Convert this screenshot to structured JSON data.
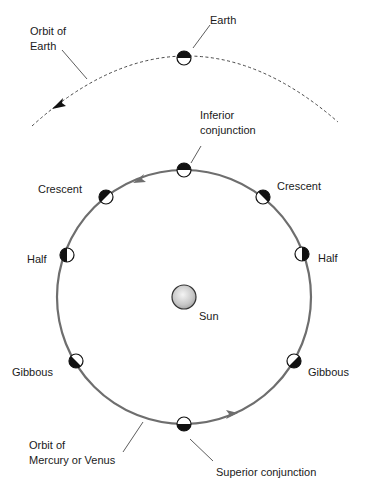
{
  "diagram": {
    "labels": {
      "earth": "Earth",
      "orbit_earth_line1": "Orbit of",
      "orbit_earth_line2": "Earth",
      "inferior_line1": "Inferior",
      "inferior_line2": "conjunction",
      "crescent_left": "Crescent",
      "crescent_right": "Crescent",
      "half_left": "Half",
      "half_right": "Half",
      "sun": "Sun",
      "gibbous_left": "Gibbous",
      "gibbous_right": "Gibbous",
      "orbit_inner_line1": "Orbit of",
      "orbit_inner_line2": "Mercury or Venus",
      "superior": "Superior conjunction"
    },
    "colors": {
      "orbit": "#6e6e6e",
      "dark_side": "#111111",
      "lit_side": "#ffffff",
      "text": "#1a1a1a"
    }
  }
}
